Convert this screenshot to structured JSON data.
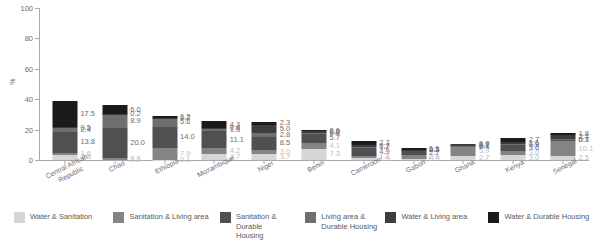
{
  "chart_data": {
    "type": "bar",
    "subtype": "stacked-bar",
    "title": "",
    "xlabel": "",
    "ylabel": "%",
    "ylim": [
      0,
      100
    ],
    "yticks": [
      0,
      20,
      40,
      60,
      80,
      100
    ],
    "grid": false,
    "legend_position": "bottom",
    "categories": [
      "Central African\nRepublic",
      "Chad",
      "Ethiopia",
      "Mozambique",
      "Niger",
      "Benin",
      "Cameroon",
      "Gabon",
      "Ghana",
      "Kenya",
      "Senegal"
    ],
    "series": [
      {
        "name": "Water & Sanitation",
        "color": "#d5d6d8",
        "values": [
          3.3,
          0.0,
          0.1,
          3.7,
          3.7,
          7.3,
          1.5,
          0.9,
          2.7,
          3.0,
          2.5
        ]
      },
      {
        "name": "Sanitation & Living area",
        "color": "#828486",
        "values": [
          1.6,
          1.1,
          7.9,
          4.2,
          3.0,
          4.1,
          1.3,
          2.5,
          5.9,
          3.0,
          10.1
        ]
      },
      {
        "name": "Sanitation &  Durable\nHousing",
        "color": "#4e5052",
        "values": [
          13.8,
          20.0,
          14.0,
          11.1,
          8.5,
          5.7,
          4.9,
          2.7,
          0.4,
          3.6,
          0.7
        ]
      },
      {
        "name": "Living area &\nDurable Housing",
        "color": "#6d6f71",
        "values": [
          2.4,
          8.9,
          5.6,
          1.5,
          2.8,
          0.8,
          1.2,
          0.5,
          0.1,
          0.9,
          0.3
        ]
      },
      {
        "name": "Water & Living area",
        "color": "#3c3d3f",
        "values": [
          0.5,
          0.2,
          0.2,
          0.6,
          5.0,
          1.0,
          0.7,
          0.2,
          1.7,
          1.6,
          2.7
        ]
      },
      {
        "name": "Water & Durable Housing",
        "color": "#1a1b1d",
        "values": [
          17.5,
          6.0,
          1.2,
          4.3,
          2.3,
          0.6,
          2.7,
          1.1,
          0.0,
          2.7,
          1.8
        ]
      }
    ],
    "value_labels": [
      [
        "3.3",
        "1.6",
        "13.8",
        "2.4",
        "0.5",
        "17.5"
      ],
      [
        "0.0",
        "1.1",
        "20.0",
        "8.9",
        "0.2",
        "6.0"
      ],
      [
        "0.1",
        "7.9",
        "14.0",
        "5.6",
        "0.2",
        "1.2"
      ],
      [
        "3.7",
        "4.2",
        "11.1",
        "1.5",
        "0.6",
        "4.3"
      ],
      [
        "3.7",
        "3.0",
        "8.5",
        "2.8",
        "5.0",
        "2.3"
      ],
      [
        "7.3",
        "4.1",
        "5.7",
        "0.8",
        "1.0",
        "0.6"
      ],
      [
        "1.5",
        "1.3",
        "4.9",
        "1.2",
        "0.7",
        "2.7"
      ],
      [
        "0.9",
        "2.5",
        "2.7",
        "0.5",
        "0.2",
        "1.1"
      ],
      [
        "2.7",
        "5.9",
        "0.4",
        "0.1",
        "1.7",
        "0.0"
      ],
      [
        "3.0",
        "3.0",
        "3.6",
        "0.9",
        "1.6",
        "2.7"
      ],
      [
        "2.5",
        "10.1",
        "0.7",
        "0.3",
        "2.7",
        "1.8"
      ]
    ]
  }
}
